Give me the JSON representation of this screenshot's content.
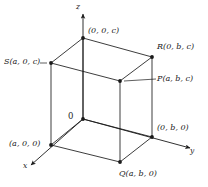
{
  "figure": {
    "kind": "3d-rectangular-box-coordinate-diagram",
    "stroke_color": "#1a1a1a",
    "background_color": "#ffffff",
    "axes": [
      {
        "id": "x",
        "label": "x",
        "label_x": 25,
        "label_y": 167
      },
      {
        "id": "y",
        "label": "y",
        "label_x": 189,
        "label_y": 152
      },
      {
        "id": "z",
        "label": "z",
        "label_x": 76,
        "label_y": 4
      }
    ],
    "origin": {
      "label": "0",
      "label_x": 68,
      "label_y": 114,
      "vx": 83,
      "vy": 119
    },
    "vertices": [
      {
        "name": "top-back",
        "label": "(0, 0, c)",
        "vx": 83,
        "vy": 38,
        "label_x": 88,
        "label_y": 28
      },
      {
        "name": "S",
        "label": "S(a, 0, c)",
        "vx": 51,
        "vy": 63,
        "label_x": 4,
        "label_y": 58
      },
      {
        "name": "R",
        "label": "R(0, b, c)",
        "vx": 152,
        "vy": 57,
        "label_x": 158,
        "label_y": 44
      },
      {
        "name": "P",
        "label": "P(a, b, c)",
        "vx": 120,
        "vy": 81,
        "label_x": 158,
        "label_y": 76
      },
      {
        "name": "x-axis-pt",
        "label": "(a, 0, 0)",
        "vx": 51,
        "vy": 145,
        "label_x": 10,
        "label_y": 140
      },
      {
        "name": "y-axis-pt",
        "label": "(0, b, 0)",
        "vx": 152,
        "vy": 137,
        "label_x": 157,
        "label_y": 124
      },
      {
        "name": "Q",
        "label": "Q(a, b, 0)",
        "vx": 120,
        "vy": 162,
        "label_x": 120,
        "label_y": 170
      }
    ]
  }
}
